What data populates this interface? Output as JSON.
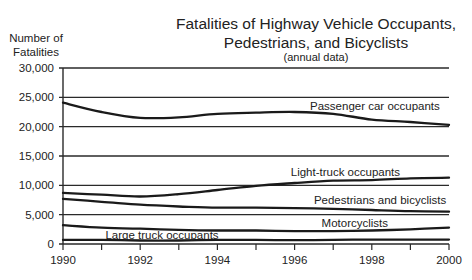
{
  "chart_data": {
    "type": "line",
    "title_lines": [
      "Fatalities of Highway Vehicle Occupants,",
      "Pedestrians, and Bicyclists"
    ],
    "subtitle": "(annual data)",
    "xlabel": "",
    "ylabel": "Number of Fatalities",
    "ylabel_lines": [
      "Number of",
      "Fatalities"
    ],
    "xlim": [
      1990,
      2000
    ],
    "ylim": [
      0,
      30000
    ],
    "x_ticks": [
      1990,
      1991,
      1992,
      1993,
      1994,
      1995,
      1996,
      1997,
      1998,
      1999,
      2000
    ],
    "x_tick_labels": [
      "1990",
      "1992",
      "1994",
      "1996",
      "1998",
      "2000"
    ],
    "x_tick_label_values": [
      1990,
      1992,
      1994,
      1996,
      1998,
      2000
    ],
    "y_ticks": [
      0,
      5000,
      10000,
      15000,
      20000,
      25000,
      30000
    ],
    "y_tick_labels": [
      "0",
      "5,000",
      "10,000",
      "15,000",
      "20,000",
      "25,000",
      "30,000"
    ],
    "grid": "horizontal",
    "legend": "inline labels on lines",
    "x": [
      1990,
      1991,
      1992,
      1993,
      1994,
      1995,
      1996,
      1997,
      1998,
      1999,
      2000
    ],
    "series": [
      {
        "name": "Passenger car occupants",
        "values": [
          24100,
          22500,
          21500,
          21600,
          22200,
          22400,
          22500,
          22200,
          21200,
          20800,
          20300
        ],
        "label_x": 1996.4,
        "label_y": 23500
      },
      {
        "name": "Light-truck occupants",
        "values": [
          8700,
          8400,
          8100,
          8500,
          9200,
          9900,
          10400,
          10800,
          10900,
          11200,
          11300
        ],
        "label_x": 1995.9,
        "label_y": 12200
      },
      {
        "name": "Pedestrians and bicyclists",
        "values": [
          7700,
          7200,
          6700,
          6400,
          6200,
          6200,
          6100,
          6000,
          5800,
          5600,
          5500
        ],
        "label_x": 1996.5,
        "label_y": 7500
      },
      {
        "name": "Motorcyclists",
        "values": [
          3200,
          2800,
          2600,
          2400,
          2300,
          2300,
          2200,
          2200,
          2300,
          2500,
          2800
        ],
        "label_x": 1996.7,
        "label_y": 3600
      },
      {
        "name": "Large truck occupants",
        "values": [
          700,
          700,
          600,
          600,
          700,
          700,
          650,
          700,
          750,
          750,
          750
        ],
        "label_x": 1991.1,
        "label_y": 1500
      }
    ],
    "colors": {
      "line": "#1a1a1a",
      "grid": "#2a2a2a",
      "background": "#ffffff"
    }
  }
}
